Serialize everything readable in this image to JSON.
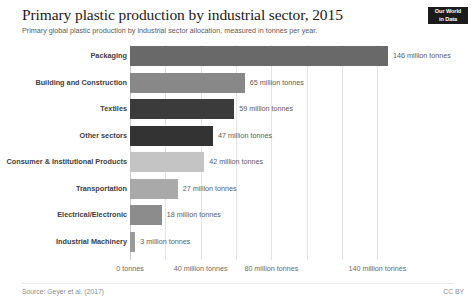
{
  "header": {
    "title": "Primary plastic production by industrial sector, 2015",
    "subtitle": "Primary global plastic production by industrial sector allocation, measured in tonnes per year.",
    "logo_line1": "Our World",
    "logo_line2": "in Data"
  },
  "footer": {
    "source": "Source: Geyer et al. (2017)",
    "license": "CC BY"
  },
  "chart_data": {
    "type": "bar",
    "orientation": "horizontal",
    "title": "Primary plastic production by industrial sector, 2015",
    "subtitle": "Primary global plastic production by industrial sector allocation, measured in tonnes per year.",
    "xlabel": "",
    "ylabel": "",
    "unit": "million tonnes",
    "xlim": [
      0,
      146
    ],
    "grid": true,
    "legend": "none",
    "axis_ticks": [
      {
        "value": 0,
        "label": "0 tonnes"
      },
      {
        "value": 20,
        "label": ""
      },
      {
        "value": 40,
        "label": "40 million tonnes"
      },
      {
        "value": 60,
        "label": ""
      },
      {
        "value": 80,
        "label": "80 million tonnes"
      },
      {
        "value": 100,
        "label": ""
      },
      {
        "value": 120,
        "label": ""
      },
      {
        "value": 140,
        "label": "140 million tonnes"
      }
    ],
    "categories": [
      "Packaging",
      "Building and Construction",
      "Textiles",
      "Other sectors",
      "Consumer & Institutional Products",
      "Transportation",
      "Electrical/Electronic",
      "Industrial Machinery"
    ],
    "values": [
      146,
      65,
      59,
      47,
      42,
      27,
      18,
      3
    ],
    "value_labels": [
      "146 million tonnes",
      "65 million tonnes",
      "59 million tonnes",
      "47 million tonnes",
      "42 million tonnes",
      "27 million tonnes",
      "18 million tonnes",
      "3 million tonnes"
    ],
    "colors": [
      "#696969",
      "#888888",
      "#3b3b3b",
      "#333333",
      "#c4c4c4",
      "#a9a9a9",
      "#8c8c8c",
      "#9a9a9a"
    ]
  }
}
